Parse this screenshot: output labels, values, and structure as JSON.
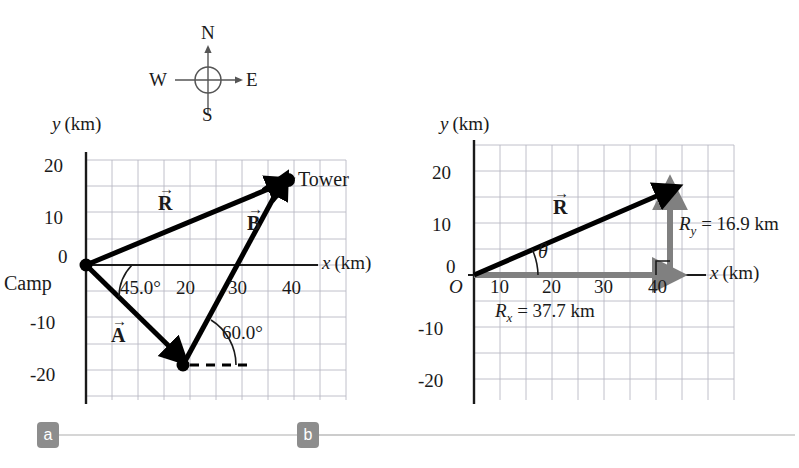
{
  "figure": {
    "type": "vector-addition-diagram",
    "panels": [
      {
        "id": "a",
        "badge": "a",
        "axis": {
          "y_label": "y",
          "y_unit": "(km)",
          "x_label": "x",
          "x_unit": "(km)",
          "y_ticks": [
            "20",
            "10",
            "0",
            "-10",
            "-20"
          ],
          "x_ticks": [
            "20",
            "30",
            "40"
          ],
          "x_range": [
            -5,
            50
          ],
          "y_range": [
            -25,
            25
          ],
          "grid_step": 5
        },
        "points": [
          {
            "name": "Camp",
            "label": "Camp",
            "x": 0,
            "y": 0
          },
          {
            "name": "Tower",
            "label": "Tower",
            "x": 37.7,
            "y": 16.9
          },
          {
            "name": "turn",
            "label": "",
            "x": 17.7,
            "y": -17.3
          }
        ],
        "vectors": [
          {
            "name": "A",
            "label": "A",
            "from": [
              0,
              0
            ],
            "to": [
              17.7,
              -17.3
            ],
            "color": "#000000"
          },
          {
            "name": "B",
            "label": "B",
            "from": [
              17.7,
              -17.3
            ],
            "to": [
              37.7,
              16.9
            ],
            "color": "#000000"
          },
          {
            "name": "R",
            "label": "R",
            "from": [
              0,
              0
            ],
            "to": [
              37.7,
              16.9
            ],
            "color": "#000000"
          }
        ],
        "angles": [
          {
            "name": "angle-A",
            "label": "45.0°"
          },
          {
            "name": "angle-B",
            "label": "60.0°"
          }
        ]
      },
      {
        "id": "b",
        "badge": "b",
        "axis": {
          "y_label": "y",
          "y_unit": "(km)",
          "x_label": "x",
          "x_unit": "(km)",
          "origin_label": "O",
          "y_ticks": [
            "20",
            "10",
            "0",
            "-10",
            "-20"
          ],
          "x_ticks": [
            "10",
            "20",
            "30",
            "40"
          ],
          "x_range": [
            -5,
            50
          ],
          "y_range": [
            -25,
            25
          ],
          "grid_step": 5
        },
        "vectors": [
          {
            "name": "R",
            "label": "R",
            "from": [
              0,
              0
            ],
            "to": [
              37.7,
              16.9
            ],
            "color": "#000000"
          },
          {
            "name": "Rx",
            "label": "R",
            "sub": "x",
            "from": [
              0,
              0
            ],
            "to": [
              37.7,
              0
            ],
            "color": "#808080"
          },
          {
            "name": "Ry",
            "label": "R",
            "sub": "y",
            "from": [
              37.7,
              0
            ],
            "to": [
              37.7,
              16.9
            ],
            "color": "#808080"
          }
        ],
        "components": {
          "rx_text_prefix": "R",
          "rx_text_sub": "x",
          "rx_text_value": " = 37.7 km",
          "ry_text_prefix": "R",
          "ry_text_sub": "y",
          "ry_text_value": " = 16.9 km"
        },
        "angles": [
          {
            "name": "angle-theta",
            "label": "θ"
          }
        ]
      }
    ],
    "compass": {
      "north": "N",
      "east": "E",
      "south": "S",
      "west": "W"
    },
    "colors": {
      "grid": "#b9b9c4",
      "axis": "#1a1a1a",
      "vector": "#000000",
      "component": "#808080",
      "badge_bg": "#8d8d8d",
      "rule": "#c9c9c9"
    }
  }
}
